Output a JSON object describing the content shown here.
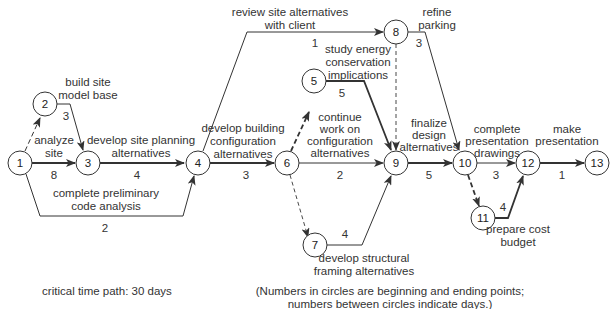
{
  "diagram": {
    "type": "critical path network (CPM)",
    "nodes": [
      {
        "id": "1",
        "label": "1"
      },
      {
        "id": "2",
        "label": "2"
      },
      {
        "id": "3",
        "label": "3"
      },
      {
        "id": "4",
        "label": "4"
      },
      {
        "id": "5",
        "label": "5"
      },
      {
        "id": "6",
        "label": "6"
      },
      {
        "id": "7",
        "label": "7"
      },
      {
        "id": "8",
        "label": "8"
      },
      {
        "id": "9",
        "label": "9"
      },
      {
        "id": "10",
        "label": "10"
      },
      {
        "id": "11",
        "label": "11"
      },
      {
        "id": "12",
        "label": "12"
      },
      {
        "id": "13",
        "label": "13"
      }
    ],
    "activities": [
      {
        "from": "1",
        "to": "2",
        "name": "",
        "days": "",
        "style": "dashed"
      },
      {
        "from": "2",
        "to": "3",
        "name": "build site model base",
        "days": "3",
        "style": "solid"
      },
      {
        "from": "1",
        "to": "3",
        "name": "analyze site",
        "days": "8",
        "style": "bold"
      },
      {
        "from": "3",
        "to": "4",
        "name": "develop site planning alternatives",
        "days": "4",
        "style": "bold"
      },
      {
        "from": "1",
        "to": "4",
        "name": "complete preliminary code analysis",
        "days": "2",
        "style": "solid"
      },
      {
        "from": "4",
        "to": "6",
        "name": "develop building configuration alternatives",
        "days": "3",
        "style": "bold"
      },
      {
        "from": "4",
        "to": "8",
        "name": "review site alternatives with client",
        "days": "1",
        "style": "solid"
      },
      {
        "from": "6",
        "to": "5",
        "name": "",
        "days": "",
        "style": "dashed-bold"
      },
      {
        "from": "5",
        "to": "9",
        "name": "study energy conservation implications",
        "days": "5",
        "style": "bold"
      },
      {
        "from": "6",
        "to": "9",
        "name": "continue work on configuration alternatives",
        "days": "2",
        "style": "solid"
      },
      {
        "from": "6",
        "to": "7",
        "name": "",
        "days": "",
        "style": "dashed"
      },
      {
        "from": "7",
        "to": "9",
        "name": "develop structural framing alternatives",
        "days": "4",
        "style": "solid"
      },
      {
        "from": "8",
        "to": "9",
        "name": "",
        "days": "",
        "style": "dashed"
      },
      {
        "from": "8",
        "to": "10",
        "name": "refine parking",
        "days": "3",
        "style": "solid"
      },
      {
        "from": "9",
        "to": "10",
        "name": "finalize design alternatives",
        "days": "5",
        "style": "bold"
      },
      {
        "from": "10",
        "to": "12",
        "name": "complete presentation drawings",
        "days": "3",
        "style": "solid"
      },
      {
        "from": "10",
        "to": "11",
        "name": "",
        "days": "",
        "style": "dashed-bold"
      },
      {
        "from": "11",
        "to": "12",
        "name": "prepare cost budget",
        "days": "4",
        "style": "bold"
      },
      {
        "from": "12",
        "to": "13",
        "name": "make presentation",
        "days": "1",
        "style": "bold"
      }
    ],
    "labels": {
      "build_site": [
        "build site",
        "model base"
      ],
      "analyze_site": [
        "analyze",
        "site"
      ],
      "site_planning": [
        "develop site planning",
        "alternatives"
      ],
      "code_analysis": [
        "complete preliminary",
        "code analysis"
      ],
      "building_config": [
        "develop building",
        "configuration",
        "alternatives"
      ],
      "review_site": [
        "review site alternatives",
        "with client"
      ],
      "energy": [
        "study energy",
        "conservation",
        "implications"
      ],
      "continue_work": [
        "continue",
        "work on",
        "configuration",
        "alternatives"
      ],
      "structural": [
        "develop structural",
        "framing alternatives"
      ],
      "refine_parking": [
        "refine",
        "parking"
      ],
      "finalize": [
        "finalize",
        "design",
        "alternatives"
      ],
      "presentation_drawings": [
        "complete",
        "presentation",
        "drawings"
      ],
      "make_presentation": [
        "make",
        "presentation"
      ],
      "cost_budget": [
        "prepare cost",
        "budget"
      ]
    },
    "durations": {
      "d2_3": "3",
      "d1_3": "8",
      "d3_4": "4",
      "d1_4": "2",
      "d4_6": "3",
      "d4_8": "1",
      "d5_9": "5",
      "d6_9": "2",
      "d7_9": "4",
      "d8_10": "3",
      "d9_10": "5",
      "d10_12": "3",
      "d11_12": "4",
      "d12_13": "1"
    },
    "footer": {
      "critical_path": "critical time path: 30 days",
      "note_line1": "(Numbers in circles are beginning and ending points;",
      "note_line2": "numbers between circles indicate days.)"
    }
  }
}
